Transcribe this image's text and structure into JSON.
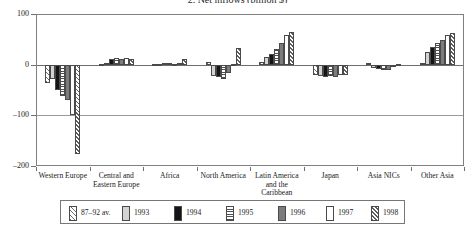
{
  "chart_data": {
    "type": "bar",
    "title": "2. Net inflows (billion $)",
    "xlabel": "",
    "ylabel": "",
    "ylim": [
      -200,
      100
    ],
    "yticks": [
      100,
      0,
      -100,
      -200
    ],
    "ytick_labels": [
      "100",
      "0",
      "–100",
      "–200"
    ],
    "grid": true,
    "legend_position": "bottom",
    "categories": [
      "Western Europe",
      "Central and Eastern Europe",
      "Africa",
      "North America",
      "Latin America and the Caribbean",
      "Japan",
      "Asia NICs",
      "Other Asia"
    ],
    "series": [
      {
        "name": "87–92 av.",
        "pattern": "diagonal-hatch-light",
        "values": [
          -36,
          2,
          1,
          6,
          5,
          -20,
          3,
          3
        ]
      },
      {
        "name": "1993",
        "pattern": "light-gray",
        "values": [
          -29,
          4,
          2,
          -22,
          15,
          -22,
          -6,
          25
        ]
      },
      {
        "name": "1994",
        "pattern": "black",
        "values": [
          -51,
          11,
          3,
          -25,
          22,
          -24,
          -8,
          35
        ]
      },
      {
        "name": "1995",
        "pattern": "horizontal-stripes",
        "values": [
          -62,
          13,
          3,
          -28,
          30,
          -23,
          -10,
          42
        ]
      },
      {
        "name": "1996",
        "pattern": "dark-gray",
        "values": [
          -69,
          12,
          2,
          -16,
          42,
          -24,
          -11,
          48
        ]
      },
      {
        "name": "1997",
        "pattern": "white",
        "values": [
          -100,
          14,
          3,
          2,
          58,
          -20,
          -5,
          58
        ]
      },
      {
        "name": "1998",
        "pattern": "diagonal-hatch-dense",
        "values": [
          -176,
          11,
          12,
          32,
          65,
          -21,
          2,
          62
        ]
      }
    ]
  },
  "legend": {
    "items": [
      {
        "label": "87–92 av."
      },
      {
        "label": "1993"
      },
      {
        "label": "1994"
      },
      {
        "label": "1995"
      },
      {
        "label": "1996"
      },
      {
        "label": "1997"
      },
      {
        "label": "1998"
      }
    ]
  },
  "colors": {
    "frame": "#808080",
    "gridline": "#9a9a9a",
    "bar_outline": "#4a4a4a",
    "series_1993": "#d3d3d3",
    "series_1994": "#151515",
    "series_1996": "#7c7c7c",
    "series_1997": "#ffffff",
    "background": "#ffffff"
  }
}
